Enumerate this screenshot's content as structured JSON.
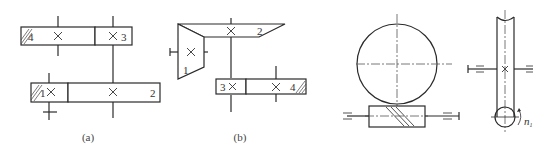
{
  "figure": {
    "panels": [
      {
        "id": "a",
        "caption": "(a)",
        "gears": [
          {
            "label": "4",
            "driven_hatch": true
          },
          {
            "label": "3"
          },
          {
            "label": "1",
            "driven_hatch": true
          },
          {
            "label": "2"
          }
        ]
      },
      {
        "id": "b",
        "caption": "(b)",
        "gears": [
          {
            "label": "1",
            "type": "bevel"
          },
          {
            "label": "2",
            "type": "bevel"
          },
          {
            "label": "3"
          },
          {
            "label": "4",
            "driven_hatch": true
          }
        ]
      },
      {
        "id": "c",
        "caption": "",
        "type": "worm-gear",
        "rotation_label": "n",
        "rotation_subscript": "1"
      }
    ]
  },
  "colors": {
    "line": "#2a2a2a",
    "background": "#ffffff"
  }
}
